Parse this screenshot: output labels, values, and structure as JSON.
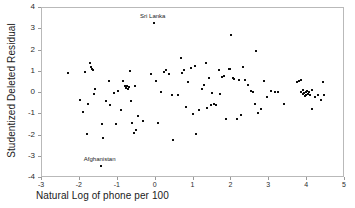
{
  "chart_data": {
    "type": "scatter",
    "title": "",
    "xlabel": "Natural Log of phone per 100",
    "ylabel": "Studentized Deleted Residual",
    "xlim": [
      -3,
      5
    ],
    "ylim": [
      -4,
      4
    ],
    "xticks": [
      -3,
      -2,
      -1,
      0,
      1,
      2,
      3,
      4,
      5
    ],
    "yticks": [
      -4,
      -3,
      -2,
      -1,
      0,
      1,
      2,
      3,
      4
    ],
    "grid": false,
    "legend": null,
    "marker": "filled-square",
    "marker_color": "#0d0d0d",
    "frame_color": "#b9b9b9",
    "annotations": [
      {
        "label": "Sri Lanka",
        "x": -0.05,
        "y": 3.3,
        "position": "above"
      },
      {
        "label": "Afghanistan",
        "x": -1.45,
        "y": -3.45,
        "position": "above"
      }
    ],
    "points": [
      [
        -2.32,
        0.93
      ],
      [
        -1.99,
        -0.33
      ],
      [
        -1.93,
        -0.88
      ],
      [
        -1.86,
        1.01
      ],
      [
        -1.82,
        -1.95
      ],
      [
        -1.78,
        -0.52
      ],
      [
        -1.73,
        1.41
      ],
      [
        -1.7,
        1.22
      ],
      [
        -1.68,
        1.12
      ],
      [
        -1.66,
        1.09
      ],
      [
        -1.63,
        -0.07
      ],
      [
        -1.59,
        0.18
      ],
      [
        -1.45,
        -3.45
      ],
      [
        -1.42,
        -1.46
      ],
      [
        -1.38,
        -2.1
      ],
      [
        -1.3,
        -0.38
      ],
      [
        -1.22,
        0.58
      ],
      [
        -1.2,
        -0.55
      ],
      [
        -1.1,
        0.02
      ],
      [
        -1.05,
        -1.46
      ],
      [
        -1.0,
        0.09
      ],
      [
        -0.92,
        -0.81
      ],
      [
        -0.86,
        0.58
      ],
      [
        -0.8,
        0.31
      ],
      [
        -0.77,
        0.23
      ],
      [
        -0.75,
        0.34
      ],
      [
        -0.73,
        0.19
      ],
      [
        -0.71,
        0.27
      ],
      [
        -0.68,
        1.03
      ],
      [
        -0.66,
        -0.39
      ],
      [
        -0.63,
        -1.4
      ],
      [
        -0.58,
        -1.88
      ],
      [
        -0.55,
        0.33
      ],
      [
        -0.52,
        -1.72
      ],
      [
        -0.47,
        -1.09
      ],
      [
        -0.33,
        -1.34
      ],
      [
        -0.12,
        0.88
      ],
      [
        -0.05,
        3.3
      ],
      [
        0.02,
        0.55
      ],
      [
        0.07,
        -1.42
      ],
      [
        0.15,
        0.06
      ],
      [
        0.22,
        0.97
      ],
      [
        0.28,
        1.09
      ],
      [
        0.36,
        0.88
      ],
      [
        0.44,
        -0.09
      ],
      [
        0.47,
        -2.22
      ],
      [
        0.6,
        -0.08
      ],
      [
        0.66,
        1.66
      ],
      [
        0.7,
        0.92
      ],
      [
        0.76,
        1.08
      ],
      [
        0.8,
        -0.66
      ],
      [
        0.86,
        0.52
      ],
      [
        0.93,
        1.19
      ],
      [
        0.99,
        -1.0
      ],
      [
        1.04,
        1.25
      ],
      [
        1.07,
        -1.95
      ],
      [
        1.15,
        -0.78
      ],
      [
        1.22,
        0.19
      ],
      [
        1.28,
        0.39
      ],
      [
        1.33,
        1.43
      ],
      [
        1.36,
        -0.7
      ],
      [
        1.42,
        0.69
      ],
      [
        1.47,
        -0.58
      ],
      [
        1.5,
        0.02
      ],
      [
        1.55,
        -0.5
      ],
      [
        1.6,
        -0.57
      ],
      [
        1.66,
        1.1
      ],
      [
        1.7,
        -0.06
      ],
      [
        1.76,
        0.74
      ],
      [
        1.8,
        0.78
      ],
      [
        1.86,
        -1.2
      ],
      [
        1.93,
        1.12
      ],
      [
        1.97,
        1.15
      ],
      [
        2.0,
        2.71
      ],
      [
        2.03,
        0.7
      ],
      [
        2.08,
        0.66
      ],
      [
        2.14,
        -1.2
      ],
      [
        2.2,
        0.62
      ],
      [
        2.26,
        -1.05
      ],
      [
        2.3,
        1.23
      ],
      [
        2.36,
        0.61
      ],
      [
        2.45,
        0.37
      ],
      [
        2.52,
        0.09
      ],
      [
        2.57,
        0.06
      ],
      [
        2.62,
        -0.53
      ],
      [
        2.66,
        1.99
      ],
      [
        2.7,
        -0.92
      ],
      [
        2.78,
        -0.75
      ],
      [
        2.86,
        0.56
      ],
      [
        2.95,
        -0.21
      ],
      [
        3.05,
        0.09
      ],
      [
        3.14,
        0.03
      ],
      [
        3.22,
        0.06
      ],
      [
        3.38,
        -0.5
      ],
      [
        3.72,
        0.53
      ],
      [
        3.78,
        0.58
      ],
      [
        3.83,
        0.62
      ],
      [
        3.85,
        0.03
      ],
      [
        3.88,
        -0.05
      ],
      [
        3.9,
        0.16
      ],
      [
        3.92,
        -0.02
      ],
      [
        3.94,
        -0.12
      ],
      [
        3.96,
        0.06
      ],
      [
        3.98,
        -0.08
      ],
      [
        4.0,
        0.1
      ],
      [
        4.02,
        -0.04
      ],
      [
        4.05,
        0.07
      ],
      [
        4.08,
        -0.09
      ],
      [
        4.12,
        0.13
      ],
      [
        4.14,
        -0.77
      ],
      [
        4.2,
        -0.18
      ],
      [
        4.28,
        -0.08
      ],
      [
        4.36,
        -0.35
      ],
      [
        4.42,
        0.5
      ],
      [
        4.45,
        -0.1
      ]
    ]
  }
}
